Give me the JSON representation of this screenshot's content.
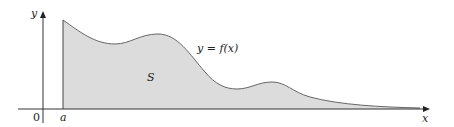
{
  "diagram": {
    "labels": {
      "y_axis": "y",
      "x_axis": "x",
      "origin": "0",
      "a": "a",
      "region": "S",
      "curve": "y = f(x)"
    },
    "colors": {
      "fill": "#dcdcdc",
      "curve": "#555555",
      "axes": "#333333"
    }
  }
}
